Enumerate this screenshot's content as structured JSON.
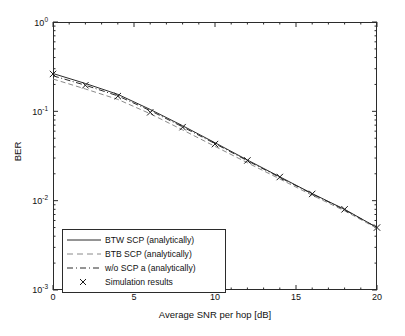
{
  "chart_data": {
    "type": "line",
    "title": "",
    "xlabel": "Average SNR per hop [dB]",
    "ylabel": "BER",
    "xlim": [
      0,
      20
    ],
    "ylim": [
      0.001,
      1
    ],
    "yscale": "log",
    "xticks": [
      "0",
      "5",
      "10",
      "15",
      "20"
    ],
    "xtick_values": [
      0,
      5,
      10,
      15,
      20
    ],
    "ytick_labels": [
      {
        "mantissa": "10",
        "exponent": "0"
      },
      {
        "mantissa": "10",
        "exponent": "-1"
      },
      {
        "mantissa": "10",
        "exponent": "-2"
      },
      {
        "mantissa": "10",
        "exponent": "-3"
      }
    ],
    "ytick_values": [
      1,
      0.1,
      0.01,
      0.001
    ],
    "grid": false,
    "legend_position": "lower left",
    "x": [
      0,
      2,
      4,
      6,
      8,
      10,
      12,
      14,
      16,
      18,
      20
    ],
    "series": [
      {
        "name": "BTW SCP (analytically)",
        "style": "solid",
        "color": "#2b2b2b",
        "values": [
          0.265,
          0.205,
          0.155,
          0.105,
          0.069,
          0.0445,
          0.0285,
          0.0185,
          0.012,
          0.008,
          0.005
        ]
      },
      {
        "name": "BTB SCP (analytically)",
        "style": "dashed",
        "color": "#8a8a8a",
        "values": [
          0.23,
          0.178,
          0.136,
          0.094,
          0.062,
          0.0405,
          0.0266,
          0.0175,
          0.0115,
          0.0077,
          0.0049
        ]
      },
      {
        "name": "w/o SCP  a (analytically)",
        "style": "dashdot",
        "color": "#2b2b2b",
        "values": [
          0.25,
          0.196,
          0.149,
          0.102,
          0.067,
          0.0435,
          0.028,
          0.0182,
          0.0119,
          0.0079,
          0.005
        ]
      },
      {
        "name": "Simulation results",
        "style": "marker",
        "marker": "x",
        "color": "#1a1a1a",
        "values": [
          0.262,
          0.196,
          0.148,
          0.0975,
          0.0665,
          0.043,
          0.0282,
          0.0184,
          0.0119,
          0.008,
          0.005
        ]
      }
    ],
    "legend": [
      {
        "label": "BTW SCP (analytically)",
        "style": "solid",
        "color": "#2b2b2b"
      },
      {
        "label": "BTB SCP (analytically)",
        "style": "dashed",
        "color": "#8a8a8a"
      },
      {
        "label": "w/o SCP  a (analytically)",
        "style": "dashdot",
        "color": "#2b2b2b"
      },
      {
        "label": "Simulation results",
        "style": "marker",
        "color": "#1a1a1a"
      }
    ]
  }
}
